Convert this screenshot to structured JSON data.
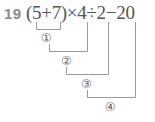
{
  "problem": {
    "number": "19",
    "expression": "(5+7)×4÷2−20"
  },
  "steps": [
    {
      "label": "①"
    },
    {
      "label": "②"
    },
    {
      "label": "③"
    },
    {
      "label": "④"
    }
  ],
  "colors": {
    "number": "#8a8a8a",
    "text": "#555555",
    "lines": "#9a9a9a"
  }
}
